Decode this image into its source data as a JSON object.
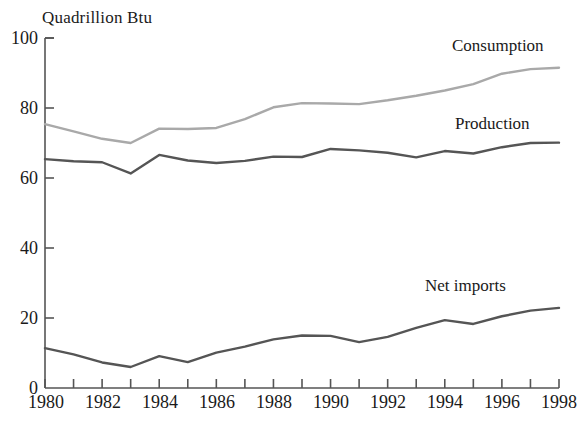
{
  "chart_data": {
    "type": "line",
    "title": "",
    "ylabel": "Quadrillion Btu",
    "xlabel": "",
    "xlim": [
      1980,
      1998
    ],
    "ylim": [
      0,
      100
    ],
    "grid": false,
    "legend_position": "inline-right",
    "x": [
      1980,
      1981,
      1982,
      1983,
      1984,
      1985,
      1986,
      1987,
      1988,
      1989,
      1990,
      1991,
      1992,
      1993,
      1994,
      1995,
      1996,
      1997,
      1998
    ],
    "series": [
      {
        "name": "Consumption",
        "color": "#a9a9a9",
        "values": [
          75.4,
          73.3,
          71.2,
          70.0,
          74.1,
          74.0,
          74.3,
          76.8,
          80.2,
          81.4,
          81.3,
          81.1,
          82.2,
          83.5,
          85.0,
          86.8,
          89.8,
          91.1,
          91.5
        ]
      },
      {
        "name": "Production",
        "color": "#555555",
        "values": [
          65.4,
          64.8,
          64.5,
          61.3,
          66.6,
          65.0,
          64.3,
          64.9,
          66.1,
          66.0,
          68.3,
          67.9,
          67.2,
          65.9,
          67.7,
          67.0,
          68.8,
          70.0,
          70.1
        ]
      },
      {
        "name": "Net imports",
        "color": "#555555",
        "values": [
          11.4,
          9.6,
          7.3,
          6.0,
          9.1,
          7.4,
          10.1,
          11.8,
          13.9,
          15.0,
          14.9,
          13.1,
          14.6,
          17.2,
          19.4,
          18.3,
          20.5,
          22.1,
          22.9
        ]
      }
    ],
    "y_ticks": [
      0,
      20,
      40,
      60,
      80,
      100
    ],
    "y_tick_labels": [
      "0",
      "20",
      "40",
      "60",
      "80",
      "100"
    ],
    "x_ticks": [
      1980,
      1981,
      1982,
      1983,
      1984,
      1985,
      1986,
      1987,
      1988,
      1989,
      1990,
      1991,
      1992,
      1993,
      1994,
      1995,
      1996,
      1997,
      1998
    ],
    "x_tick_labels": [
      "1980",
      "",
      "1982",
      "",
      "1984",
      "",
      "1986",
      "",
      "1988",
      "",
      "1990",
      "",
      "1992",
      "",
      "1994",
      "",
      "1996",
      "",
      "1998"
    ],
    "annotations": [
      {
        "text": "Consumption",
        "x": 1994.0,
        "y": 95.0
      },
      {
        "text": "Production",
        "x": 1994.0,
        "y": 75.5
      },
      {
        "text": "Net imports",
        "x": 1993.6,
        "y": 29.5
      }
    ]
  },
  "axes": {
    "axis_color": "#555555",
    "ylabel_text": "Quadrillion Btu"
  }
}
